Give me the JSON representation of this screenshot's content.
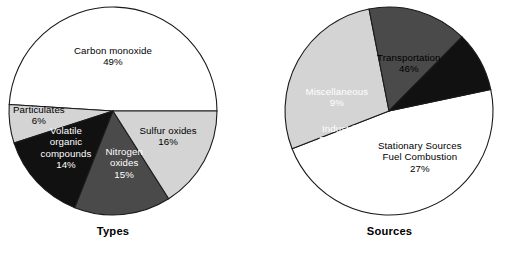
{
  "figure": {
    "background": "#ffffff",
    "outline_color": "#1a1a1a"
  },
  "palette": {
    "white": "#ffffff",
    "light_gray": "#d4d4d4",
    "dark_gray": "#4a4a4a",
    "black": "#111111"
  },
  "panels": [
    {
      "id": "types",
      "caption": "Types",
      "center_x": 113,
      "center_y": 111,
      "radius": 104
    },
    {
      "id": "sources",
      "caption": "Sources",
      "center_x": 137,
      "center_y": 111,
      "radius": 104
    }
  ],
  "chart_data": [
    {
      "type": "pie",
      "title": "Types",
      "units": "percent",
      "start_angle_deg": 0,
      "direction": "counterclockwise",
      "categories": [
        "Carbon monoxide",
        "Particulates",
        "Volatile organic compounds",
        "Nitrogen oxides",
        "Sulfur oxides"
      ],
      "values": [
        49,
        6,
        14,
        15,
        16
      ],
      "value_labels": [
        "49%",
        "6%",
        "14%",
        "15%",
        "16%"
      ],
      "colors": [
        "#ffffff",
        "#d4d4d4",
        "#111111",
        "#4a4a4a",
        "#d4d4d4"
      ],
      "slices": [
        {
          "name": "Carbon monoxide",
          "value": 49,
          "pct_label": "49%",
          "color": "#ffffff",
          "label_lines": [
            "Carbon monoxide"
          ],
          "text_tone": "on-light",
          "label_x": 113,
          "label_y": 56
        },
        {
          "name": "Particulates",
          "value": 6,
          "pct_label": "6%",
          "color": "#d4d4d4",
          "label_lines": [
            "Particulates"
          ],
          "text_tone": "on-light",
          "label_x": 39,
          "label_y": 115
        },
        {
          "name": "Volatile organic compounds",
          "value": 14,
          "pct_label": "14%",
          "color": "#111111",
          "label_lines": [
            "Volatile",
            "organic",
            "compounds"
          ],
          "text_tone": "on-dark",
          "label_x": 66,
          "label_y": 148
        },
        {
          "name": "Nitrogen oxides",
          "value": 15,
          "pct_label": "15%",
          "color": "#4a4a4a",
          "label_lines": [
            "Nitrogen",
            "oxides"
          ],
          "text_tone": "on-dark",
          "label_x": 124,
          "label_y": 163
        },
        {
          "name": "Sulfur oxides",
          "value": 16,
          "pct_label": "16%",
          "color": "#d4d4d4",
          "label_lines": [
            "Sulfur oxides"
          ],
          "text_tone": "on-light",
          "label_x": 168,
          "label_y": 136
        }
      ]
    },
    {
      "type": "pie",
      "title": "Sources",
      "units": "percent",
      "start_angle_deg": 12,
      "direction": "clockwise",
      "categories": [
        "Transportation",
        "Stationary Sources Fuel Combustion",
        "Industrial Processes",
        "Miscellaneous"
      ],
      "values": [
        46,
        27,
        15,
        9
      ],
      "value_labels": [
        "46%",
        "27%",
        "15%",
        "9%"
      ],
      "colors": [
        "#ffffff",
        "#d4d4d4",
        "#4a4a4a",
        "#111111"
      ],
      "slices": [
        {
          "name": "Transportation",
          "value": 46,
          "pct_label": "46%",
          "color": "#ffffff",
          "label_lines": [
            "Transportation"
          ],
          "text_tone": "on-light",
          "label_x": 157,
          "label_y": 63
        },
        {
          "name": "Stationary Sources Fuel Combustion",
          "value": 27,
          "pct_label": "27%",
          "color": "#d4d4d4",
          "label_lines": [
            "Stationary Sources",
            "Fuel Combustion"
          ],
          "text_tone": "on-light",
          "label_x": 168,
          "label_y": 157
        },
        {
          "name": "Industrial Processes",
          "value": 15,
          "pct_label": "15%",
          "color": "#4a4a4a",
          "label_lines": [
            "Industrial",
            "Processes"
          ],
          "text_tone": "on-dark",
          "label_x": 90,
          "label_y": 140
        },
        {
          "name": "Miscellaneous",
          "value": 9,
          "pct_label": "9%",
          "color": "#111111",
          "label_lines": [
            "Miscellaneous"
          ],
          "text_tone": "on-dark",
          "label_x": 85,
          "label_y": 97
        }
      ]
    }
  ]
}
